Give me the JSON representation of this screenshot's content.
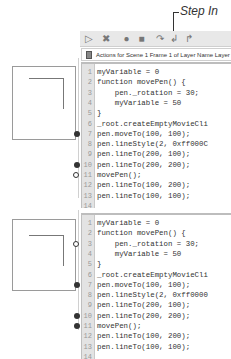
{
  "callout": {
    "label": "Step In"
  },
  "toolbar": {
    "buttons": [
      {
        "name": "continue",
        "icon": "play-icon",
        "glyph": "▷"
      },
      {
        "name": "stop-debugging",
        "icon": "close-x-icon",
        "glyph": "✖"
      },
      {
        "name": "toggle-breakpoint",
        "icon": "breakpoint-circle-icon",
        "glyph": "●"
      },
      {
        "name": "remove-all-breakpoints",
        "icon": "remove-breakpoints-icon",
        "glyph": "■"
      },
      {
        "name": "step-over",
        "icon": "step-over-icon",
        "glyph": "↷"
      },
      {
        "name": "step-in",
        "icon": "step-in-icon",
        "glyph": "↲"
      },
      {
        "name": "step-out",
        "icon": "step-out-icon",
        "glyph": "↱"
      }
    ]
  },
  "header": {
    "title": "Actions for Scene 1 Frame 1 of Layer Name Layer 1"
  },
  "editors": [
    {
      "lines": [
        {
          "n": "1",
          "code": "myVariable = 0",
          "marker": ""
        },
        {
          "n": "2",
          "code": "function movePen() {",
          "marker": ""
        },
        {
          "n": "3",
          "code": "    pen._rotation = 30;",
          "marker": ""
        },
        {
          "n": "4",
          "code": "    myVariable = 50",
          "marker": ""
        },
        {
          "n": "5",
          "code": "}",
          "marker": ""
        },
        {
          "n": "6",
          "code": "_root.createEmptyMovieCli",
          "marker": ""
        },
        {
          "n": "7",
          "code": "pen.moveTo(100, 100);",
          "marker": "breakpoint"
        },
        {
          "n": "8",
          "code": "pen.lineStyle(2, 0xff000C",
          "marker": ""
        },
        {
          "n": "9",
          "code": "pen.lineTo(200, 100);",
          "marker": ""
        },
        {
          "n": "10",
          "code": "pen.lineTo(200, 200);",
          "marker": "breakpoint"
        },
        {
          "n": "11",
          "code": "movePen();",
          "marker": "current-breakpoint"
        },
        {
          "n": "12",
          "code": "pen.lineTo(100, 200);",
          "marker": ""
        },
        {
          "n": "13",
          "code": "pen.lineTo(100, 100);",
          "marker": ""
        },
        {
          "n": "14",
          "code": "",
          "marker": ""
        }
      ]
    },
    {
      "lines": [
        {
          "n": "1",
          "code": "myVariable = 0",
          "marker": ""
        },
        {
          "n": "2",
          "code": "function movePen() {",
          "marker": ""
        },
        {
          "n": "3",
          "code": "    pen._rotation = 30;",
          "marker": "current-arrow"
        },
        {
          "n": "4",
          "code": "    myVariable = 50",
          "marker": ""
        },
        {
          "n": "5",
          "code": "}",
          "marker": ""
        },
        {
          "n": "6",
          "code": "_root.createEmptyMovieCli",
          "marker": ""
        },
        {
          "n": "7",
          "code": "pen.moveTo(100, 100);",
          "marker": "breakpoint"
        },
        {
          "n": "8",
          "code": "pen.lineStyle(2, 0xff0000",
          "marker": ""
        },
        {
          "n": "9",
          "code": "pen.lineTo(200, 100);",
          "marker": ""
        },
        {
          "n": "10",
          "code": "pen.lineTo(200, 200);",
          "marker": "breakpoint"
        },
        {
          "n": "11",
          "code": "movePen();",
          "marker": "breakpoint"
        },
        {
          "n": "12",
          "code": "pen.lineTo(100, 200);",
          "marker": ""
        },
        {
          "n": "13",
          "code": "pen.lineTo(100, 100);",
          "marker": ""
        },
        {
          "n": "14",
          "code": "",
          "marker": ""
        }
      ]
    }
  ],
  "colors": {
    "toolbar_bg": "#e8e8e8",
    "gutter_bg": "#e3e3e3",
    "code_text": "#333333",
    "line_number": "#999999"
  }
}
